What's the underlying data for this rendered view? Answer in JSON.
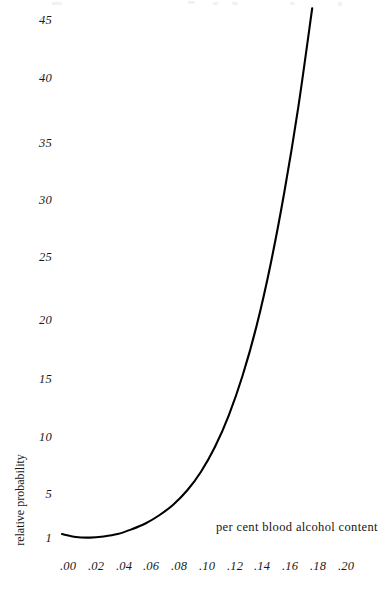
{
  "figure": {
    "background_color": "#ffffff",
    "curve_color": "#000000",
    "text_color": "#161616"
  },
  "axes": {
    "y_label": "relative probability",
    "x_label": "per cent blood alcohol content",
    "y_ticks": [
      "1",
      "5",
      "10",
      "15",
      "20",
      "25",
      "30",
      "35",
      "40",
      "45"
    ],
    "x_ticks": [
      ".00",
      ".02",
      ".04",
      ".06",
      ".08",
      ".10",
      ".12",
      ".14",
      ".16",
      ".18",
      ".20"
    ]
  },
  "chart_data": {
    "type": "line",
    "title": "",
    "subtitle": "",
    "xlabel": "per cent blood alcohol content",
    "ylabel": "relative probability",
    "xlim": [
      0.0,
      0.2
    ],
    "ylim": [
      1,
      46
    ],
    "grid": false,
    "legend": null,
    "axis_lines": false,
    "xtick_values": [
      0.0,
      0.02,
      0.04,
      0.06,
      0.08,
      0.1,
      0.12,
      0.14,
      0.16,
      0.18,
      0.2
    ],
    "xtick_labels": [
      ".00",
      ".02",
      ".04",
      ".06",
      ".08",
      ".10",
      ".12",
      ".14",
      ".16",
      ".18",
      ".20"
    ],
    "ytick_values": [
      1,
      5,
      10,
      15,
      20,
      25,
      30,
      35,
      40,
      45
    ],
    "ytick_labels": [
      "1",
      "5",
      "10",
      "15",
      "20",
      "25",
      "30",
      "35",
      "40",
      "45"
    ],
    "series": [
      {
        "name": "relative probability of crash",
        "color": "#000000",
        "x": [
          0.0,
          0.01,
          0.02,
          0.03,
          0.04,
          0.05,
          0.06,
          0.07,
          0.08,
          0.09,
          0.1,
          0.11,
          0.12,
          0.13,
          0.14,
          0.15,
          0.16,
          0.17,
          0.18
        ],
        "y": [
          1.3,
          1.05,
          1.0,
          1.1,
          1.3,
          1.7,
          2.2,
          2.9,
          3.8,
          5.0,
          6.6,
          8.7,
          11.4,
          14.8,
          19.0,
          24.2,
          30.4,
          37.6,
          46.0
        ]
      }
    ]
  }
}
